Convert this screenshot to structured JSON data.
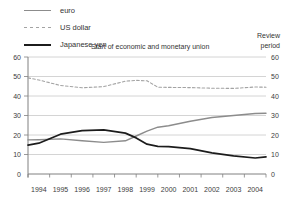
{
  "window": {
    "width": 287,
    "height": 202,
    "background": "#ffffff"
  },
  "legend": {
    "items": [
      {
        "label": "euro",
        "style": "solid",
        "color": "#8c8c8c",
        "thickness": 1.4
      },
      {
        "label": "US dollar",
        "style": "dashed",
        "color": "#a3a3a3",
        "thickness": 1.2
      },
      {
        "label": "Japanese yen",
        "style": "solid",
        "color": "#1c1c1c",
        "thickness": 2
      }
    ]
  },
  "annotations": {
    "emu_label": "Start of economic and monetary union",
    "review_label_line1": "Review",
    "review_label_line2": "period"
  },
  "chart_data": {
    "type": "line",
    "x": [
      1994,
      1994.5,
      1995.5,
      1996.5,
      1997.5,
      1998.5,
      1999,
      1999.5,
      2000,
      2000.5,
      2001.5,
      2002.5,
      2003.5,
      2004.5,
      2005
    ],
    "series": [
      {
        "name": "euro",
        "color": "#8c8c8c",
        "dash": "",
        "width": 1.4,
        "values": [
          17.5,
          17.6,
          18,
          17,
          16.2,
          17,
          19.5,
          22,
          24,
          24.7,
          27,
          29,
          30,
          31,
          31.2
        ]
      },
      {
        "name": "US dollar",
        "color": "#a3a3a3",
        "dash": "2.6,2.2",
        "width": 1.1,
        "values": [
          49.3,
          48.2,
          45.4,
          44.2,
          44.8,
          47.6,
          48,
          47.8,
          44.5,
          44.4,
          44.3,
          44,
          43.9,
          44.6,
          44.5
        ]
      },
      {
        "name": "Japanese yen",
        "color": "#1c1c1c",
        "dash": "",
        "width": 1.7,
        "values": [
          14.8,
          15.8,
          20.4,
          22.2,
          22.6,
          21,
          18.5,
          15.3,
          14.2,
          14,
          13,
          10.8,
          9.3,
          8.2,
          8.8
        ]
      }
    ],
    "xticks": [
      "1994",
      "1995",
      "1996",
      "1997",
      "1998",
      "1999",
      "2000",
      "2001",
      "2002",
      "2003",
      "2004"
    ],
    "yticks": [
      0,
      10,
      20,
      30,
      40,
      50,
      60
    ],
    "ylim": [
      0,
      60
    ],
    "xlim": [
      1994,
      2005
    ],
    "grid": true,
    "dual_y_axis": true,
    "legend_position": "top-left",
    "annotations": [
      "Start of economic and monetary union",
      "Review period"
    ]
  },
  "colors": {
    "gridline": "#c6c6c6",
    "axis": "#808080",
    "tick_text": "#3c3c3c",
    "annotation_text": "#333333"
  }
}
